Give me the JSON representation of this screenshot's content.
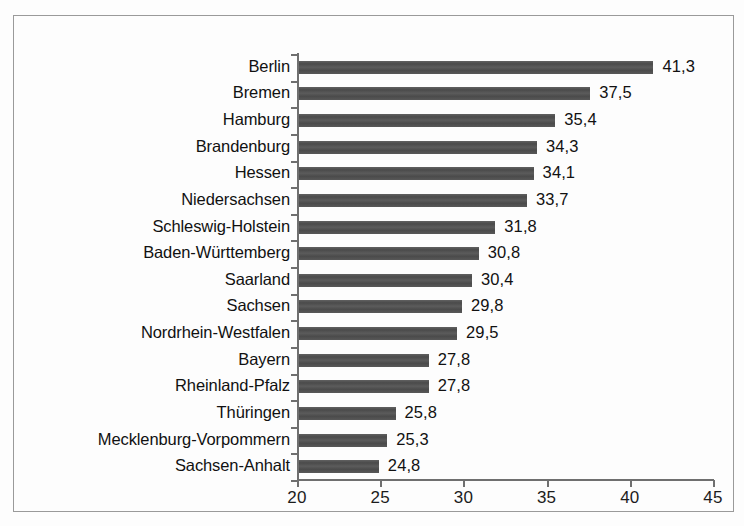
{
  "chart_data": {
    "type": "bar",
    "orientation": "horizontal",
    "title": "",
    "subtitle": "",
    "xlabel": "",
    "ylabel": "",
    "xlim": [
      20,
      45
    ],
    "xticks": [
      "20",
      "25",
      "30",
      "35",
      "40",
      "45"
    ],
    "grid": false,
    "legend": null,
    "decimal_separator": ",",
    "bar_color": "#4f4f4f",
    "axis_color": "#6f6f6f",
    "text_color": "#111111",
    "background_color": "#fdfdfd",
    "categories": [
      "Berlin",
      "Bremen",
      "Hamburg",
      "Brandenburg",
      "Hessen",
      "Niedersachsen",
      "Schleswig-Holstein",
      "Baden-Württemberg",
      "Saarland",
      "Sachsen",
      "Nordrhein-Westfalen",
      "Bayern",
      "Rheinland-Pfalz",
      "Thüringen",
      "Mecklenburg-Vorpommern",
      "Sachsen-Anhalt"
    ],
    "values": [
      41.3,
      37.5,
      35.4,
      34.3,
      34.1,
      33.7,
      31.8,
      30.8,
      30.4,
      29.8,
      29.5,
      27.8,
      27.8,
      25.8,
      25.3,
      24.8
    ],
    "value_labels": [
      "41,3",
      "37,5",
      "35,4",
      "34,3",
      "34,1",
      "33,7",
      "31,8",
      "30,8",
      "30,4",
      "29,8",
      "29,5",
      "27,8",
      "27,8",
      "25,8",
      "25,3",
      "24,8"
    ]
  }
}
